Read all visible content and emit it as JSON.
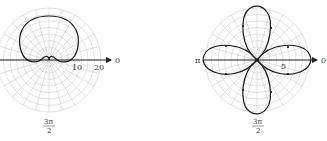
{
  "figure": {
    "left_plot": {
      "curve": "cardioid",
      "center": [
        49,
        60
      ],
      "grid_radius_px": 53,
      "scale_px_per_unit": 1.3,
      "tick_labels": [
        "10",
        "20"
      ],
      "angle_labels": {
        "zero": "0",
        "three_pi_over_two_num": "3π",
        "three_pi_over_two_den": "2"
      }
    },
    "right_plot": {
      "curve": "four-petal rose",
      "center": [
        257,
        60
      ],
      "grid_radius_px": 53,
      "tick_labels": [
        "5"
      ],
      "angle_labels": {
        "zero": "0",
        "pi": "π",
        "three_pi_over_two_num": "3π",
        "three_pi_over_two_den": "2"
      }
    },
    "colors": {
      "curve": "#1a1a1a",
      "grid": "#cfcfcf",
      "axis": "#222222",
      "text": "#333333"
    }
  }
}
